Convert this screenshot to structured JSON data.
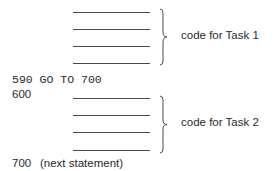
{
  "task1": {
    "label": "code for Task 1",
    "lines": 4
  },
  "goto_statement": "590 GO TO 700",
  "task2": {
    "line_number": "600",
    "label": "code for Task 2",
    "lines": 4
  },
  "next": {
    "line_number": "700",
    "text": "(next statement)"
  }
}
